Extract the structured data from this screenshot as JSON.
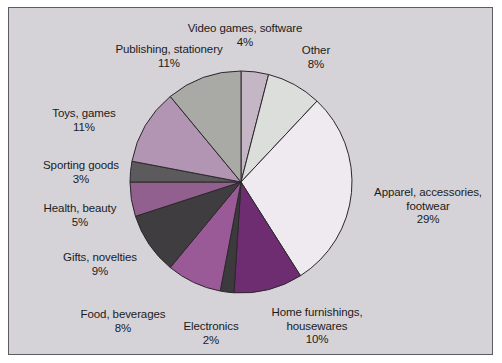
{
  "figure": {
    "panel_background": "#d6d3d8",
    "panel_border": "#5e5a62",
    "outer_background": "#ffffff"
  },
  "chart_data": {
    "type": "pie",
    "title": "",
    "subtitle": "",
    "xlabel": "",
    "ylabel": "",
    "legend_position": "none",
    "grid": false,
    "units": "percent",
    "start_angle_deg": 0,
    "direction": "clockwise",
    "categories": [
      "Video games, software",
      "Other",
      "Apparel, accessories, footwear",
      "Home furnishings, housewares",
      "Electronics",
      "Food, beverages",
      "Gifts, novelties",
      "Health, beauty",
      "Sporting goods",
      "Toys, games",
      "Publishing, stationery"
    ],
    "values": [
      4,
      8,
      29,
      10,
      2,
      8,
      9,
      5,
      3,
      11,
      11
    ],
    "colors": [
      "#c4b6c4",
      "#dcdedc",
      "#eeeaf0",
      "#6e2d70",
      "#3d3a3d",
      "#9a5a97",
      "#403d40",
      "#92608f",
      "#5d5a5d",
      "#b195b3",
      "#a9aaa6"
    ],
    "slice_edge_color": "#2b282b",
    "slices": [
      {
        "label": "Video games, software",
        "percent": 4,
        "percent_text": "4%",
        "color": "#c4b6c4"
      },
      {
        "label": "Other",
        "percent": 8,
        "percent_text": "8%",
        "color": "#dcdedc"
      },
      {
        "label": "Apparel, accessories, footwear",
        "percent": 29,
        "percent_text": "29%",
        "color": "#eeeaf0"
      },
      {
        "label": "Home furnishings, housewares",
        "percent": 10,
        "percent_text": "10%",
        "color": "#6e2d70"
      },
      {
        "label": "Electronics",
        "percent": 2,
        "percent_text": "2%",
        "color": "#3d3a3d"
      },
      {
        "label": "Food, beverages",
        "percent": 8,
        "percent_text": "8%",
        "color": "#9a5a97"
      },
      {
        "label": "Gifts, novelties",
        "percent": 9,
        "percent_text": "9%",
        "color": "#403d40"
      },
      {
        "label": "Health, beauty",
        "percent": 5,
        "percent_text": "5%",
        "color": "#92608f"
      },
      {
        "label": "Sporting goods",
        "percent": 3,
        "percent_text": "3%",
        "color": "#5d5a5d"
      },
      {
        "label": "Toys, games",
        "percent": 11,
        "percent_text": "11%",
        "color": "#b195b3"
      },
      {
        "label": "Publishing, stationery",
        "percent": 11,
        "percent_text": "11%",
        "color": "#a9aaa6"
      }
    ]
  },
  "labels": {
    "video_games": {
      "name": "Video games, software",
      "pct": "4%"
    },
    "other": {
      "name": "Other",
      "pct": "8%"
    },
    "apparel_line1": "Apparel, accessories,",
    "apparel_line2": "footwear",
    "apparel_pct": "29%",
    "home_line1": "Home furnishings,",
    "home_line2": "housewares",
    "home_pct": "10%",
    "electronics": {
      "name": "Electronics",
      "pct": "2%"
    },
    "food": {
      "name": "Food, beverages",
      "pct": "8%"
    },
    "gifts": {
      "name": "Gifts, novelties",
      "pct": "9%"
    },
    "health": {
      "name": "Health, beauty",
      "pct": "5%"
    },
    "sporting": {
      "name": "Sporting goods",
      "pct": "3%"
    },
    "toys": {
      "name": "Toys, games",
      "pct": "11%"
    },
    "publishing": {
      "name": "Publishing, stationery",
      "pct": "11%"
    }
  }
}
